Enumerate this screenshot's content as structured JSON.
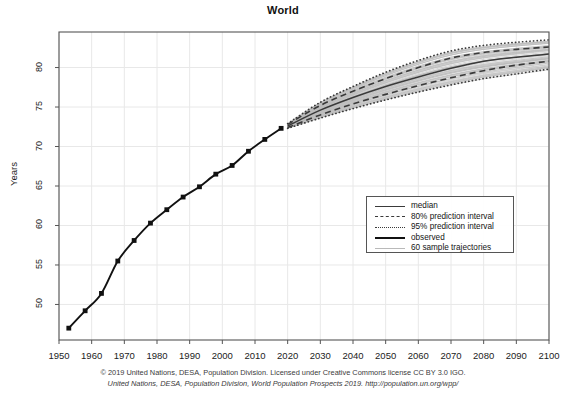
{
  "chart_data": {
    "type": "line",
    "title": "World",
    "xlabel": "",
    "ylabel": "Years",
    "xlim": [
      1950,
      2100
    ],
    "ylim": [
      45.5,
      84.5
    ],
    "grid": true,
    "legend_position": "center-right",
    "xticks": [
      1950,
      1960,
      1970,
      1980,
      1990,
      2000,
      2010,
      2020,
      2030,
      2040,
      2050,
      2060,
      2070,
      2080,
      2090,
      2100
    ],
    "yticks": [
      50,
      55,
      60,
      65,
      70,
      75,
      80
    ],
    "legend": [
      {
        "label": "median",
        "style": "solid-thin"
      },
      {
        "label": "80% prediction interval",
        "style": "dashed"
      },
      {
        "label": "95% prediction interval",
        "style": "dotted"
      },
      {
        "label": "observed",
        "style": "solid-thick"
      },
      {
        "label": "60 sample trajectories",
        "style": "solid-gray"
      }
    ],
    "series": [
      {
        "name": "observed",
        "style": "solid-thick-with-markers",
        "x": [
          1953,
          1958,
          1963,
          1968,
          1973,
          1978,
          1983,
          1988,
          1993,
          1998,
          2003,
          2008,
          2013,
          2018
        ],
        "values": [
          47.0,
          49.2,
          51.4,
          55.5,
          58.1,
          60.3,
          62.0,
          63.6,
          64.9,
          66.5,
          67.6,
          69.4,
          70.9,
          72.3
        ]
      },
      {
        "name": "median",
        "style": "solid-thin",
        "x": [
          2020,
          2030,
          2040,
          2050,
          2060,
          2070,
          2080,
          2090,
          2100
        ],
        "values": [
          72.6,
          74.6,
          76.2,
          77.6,
          78.8,
          79.9,
          80.8,
          81.3,
          81.7
        ]
      },
      {
        "name": "80% prediction interval upper",
        "style": "dashed",
        "x": [
          2020,
          2030,
          2040,
          2050,
          2060,
          2070,
          2080,
          2090,
          2100
        ],
        "values": [
          72.8,
          75.2,
          77.0,
          78.6,
          80.0,
          81.2,
          81.9,
          82.3,
          82.6
        ]
      },
      {
        "name": "80% prediction interval lower",
        "style": "dashed",
        "x": [
          2020,
          2030,
          2040,
          2050,
          2060,
          2070,
          2080,
          2090,
          2100
        ],
        "values": [
          72.4,
          74.0,
          75.4,
          76.6,
          77.7,
          78.7,
          79.6,
          80.3,
          80.8
        ]
      },
      {
        "name": "95% prediction interval upper",
        "style": "dotted",
        "x": [
          2020,
          2030,
          2040,
          2050,
          2060,
          2070,
          2080,
          2090,
          2100
        ],
        "values": [
          72.9,
          75.6,
          77.6,
          79.4,
          80.9,
          82.1,
          82.8,
          83.2,
          83.5
        ]
      },
      {
        "name": "95% prediction interval lower",
        "style": "dotted",
        "x": [
          2020,
          2030,
          2040,
          2050,
          2060,
          2070,
          2080,
          2090,
          2100
        ],
        "values": [
          72.3,
          73.6,
          74.8,
          75.9,
          76.9,
          77.8,
          78.6,
          79.2,
          79.8
        ]
      },
      {
        "name": "60 sample trajectories",
        "style": "solid-gray",
        "count": 60,
        "x": [
          2020,
          2100
        ],
        "values_range_2100": [
          79.8,
          83.5
        ]
      }
    ]
  },
  "caption": {
    "line1": "© 2019 United Nations, DESA, Population Division. Licensed under Creative Commons license CC BY 3.0 IGO.",
    "line2": "United Nations, DESA, Population Division, World Population Prospects 2019. http://population.un.org/wpp/"
  },
  "colors": {
    "median": "#3a3a3a",
    "observed": "#111111",
    "interval": "#3a3a3a",
    "trajectory": "#b9b9b9",
    "grid": "#e8e8e8",
    "axis": "#555555",
    "text": "#222222"
  }
}
